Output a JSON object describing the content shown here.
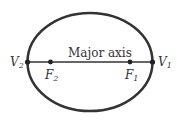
{
  "diagram": {
    "type": "ellipse",
    "axis_label": "Major axis",
    "points": [
      {
        "id": "V2",
        "label": "V",
        "sub": "2"
      },
      {
        "id": "F2",
        "label": "F",
        "sub": "2"
      },
      {
        "id": "F1",
        "label": "F",
        "sub": "1"
      },
      {
        "id": "V1",
        "label": "V",
        "sub": "1"
      }
    ],
    "colors": {
      "stroke": "#333333",
      "text": "#333333"
    }
  }
}
